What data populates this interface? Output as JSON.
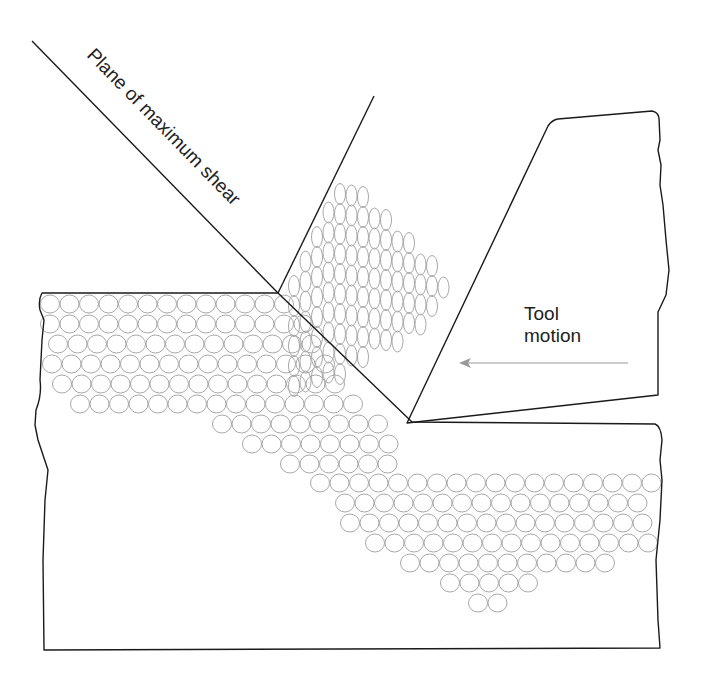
{
  "diagram": {
    "labels": {
      "shear_plane": "Plane of maximum shear",
      "tool_line1": "Tool",
      "tool_line2": "motion"
    },
    "elements": [
      "workpiece",
      "chip",
      "cutting-tool",
      "shear-plane-line",
      "tool-motion-arrow",
      "workpiece-grains",
      "chip-grains"
    ],
    "colors": {
      "outline": "#1a1a1a",
      "grain": "#a8a8a8",
      "arrow": "#9a9a9a",
      "text": "#222222"
    }
  }
}
